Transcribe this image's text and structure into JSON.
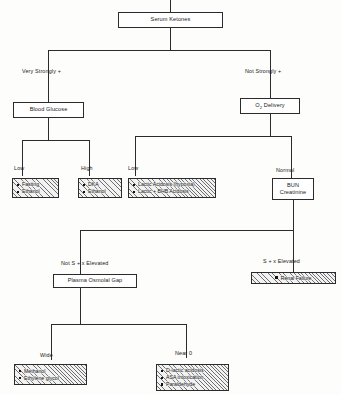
{
  "diagram": {
    "root": {
      "label": "Serum Ketones"
    },
    "branch_labels": {
      "very_strongly_positive": "Very Strongly +",
      "not_strongly_positive": "Not Strongly +",
      "glucose_low": "Low",
      "glucose_high": "High",
      "o2_low": "Low",
      "o2_normal": "Normal",
      "not_s_elevated": "Not S + x Elevated",
      "s_elevated": "S + x Elevated",
      "gap_wide": "Wide",
      "gap_near_zero": "Near 0"
    },
    "nodes": {
      "blood_glucose": "Blood Glucose",
      "o2_delivery_pre": "O",
      "o2_delivery_sub": "2",
      "o2_delivery_post": " Delivery",
      "bun_line1": "BUN",
      "bun_line2": "Creatinine",
      "plasma_osmolal_gap": "Plasma Osmolal Gap"
    },
    "outcomes": {
      "glucose_low": [
        "Fasting",
        "Ethanol"
      ],
      "glucose_high": [
        "DKA",
        "Ethanol"
      ],
      "o2_low": [
        "Lactic Acidosis (hypoxia)",
        "Lactic + BHB Acidosis"
      ],
      "renal": [
        "Renal Failure"
      ],
      "gap_wide": [
        "Methanol",
        "Ethylene glycol"
      ],
      "gap_near_zero": [
        "D-lactic acidosis",
        "ASA intoxication",
        "Paraldehyde"
      ]
    },
    "colors": {
      "line": "#2b2b2b",
      "box_fill": "#ffffff",
      "hatch_fill": "#f2f2f2",
      "hatch_stroke": "#6f6f6f",
      "page": "#fdfdfb",
      "text": "#1a1a1a"
    }
  }
}
